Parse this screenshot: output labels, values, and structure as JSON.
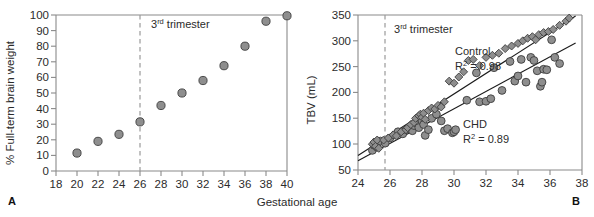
{
  "figure": {
    "shared_xlabel": "Gestational age",
    "panel_a_letter": "A",
    "panel_b_letter": "B",
    "marker_fill": "#8e8e8e",
    "marker_edge": "#3d3d3d",
    "axis_color": "#8a8a8a",
    "line_color": "#1b1b1b"
  },
  "chart_data": [
    {
      "type": "scatter",
      "panel": "A",
      "title": "",
      "xlabel": "Gestational age",
      "ylabel": "% Full-term brain weight",
      "xlim": [
        18,
        40
      ],
      "ylim": [
        0,
        100
      ],
      "xticks": [
        18,
        20,
        22,
        24,
        26,
        28,
        30,
        32,
        34,
        36,
        38,
        40
      ],
      "yticks": [
        0,
        10,
        20,
        30,
        40,
        50,
        60,
        70,
        80,
        90,
        100
      ],
      "grid": false,
      "legend": "none",
      "annotations": [
        {
          "text_main": "3",
          "text_sup": "rd",
          "text_rest": " trimester",
          "full": "3rd trimester",
          "x": 26.6,
          "y": 92
        }
      ],
      "vlines": [
        {
          "x": 26,
          "style": "dashed",
          "label": "3rd trimester"
        }
      ],
      "series": [
        {
          "name": "brain weight",
          "marker": "circle",
          "x": [
            20,
            22,
            24,
            26,
            28,
            30,
            32,
            34,
            36,
            38,
            40
          ],
          "values": [
            11.5,
            19,
            23.5,
            31.5,
            42,
            50,
            58,
            67.5,
            80,
            96,
            99.5
          ]
        }
      ]
    },
    {
      "type": "scatter",
      "panel": "B",
      "title": "",
      "xlabel": "Gestational age",
      "ylabel": "TBV (mL)",
      "xlim": [
        24,
        38
      ],
      "ylim": [
        50,
        350
      ],
      "xticks": [
        24,
        26,
        28,
        30,
        32,
        34,
        36,
        38
      ],
      "yticks": [
        50,
        100,
        150,
        200,
        250,
        300,
        350
      ],
      "grid": false,
      "legend": "inline-labels",
      "annotations": [
        {
          "text_main": "3",
          "text_sup": "rd",
          "text_rest": " trimester",
          "full": "3rd trimester",
          "x": 26.1,
          "y": 318
        },
        {
          "full": "Control",
          "x": 30.9,
          "y": 268
        },
        {
          "full": "R2 = 0.98",
          "r2_value": "0.98",
          "x": 30.9,
          "y": 251
        },
        {
          "full": "CHD",
          "x": 31.5,
          "y": 160
        },
        {
          "full": "R2 = 0.89",
          "r2_value": "0.89",
          "x": 31.5,
          "y": 143
        }
      ],
      "vlines": [
        {
          "x": 25.7,
          "style": "dashed",
          "label": "3rd trimester"
        }
      ],
      "fit_lines": [
        {
          "name": "Control",
          "x0": 24.0,
          "y0": 78,
          "x1": 37.6,
          "y1": 348
        },
        {
          "name": "CHD",
          "x0": 24.0,
          "y0": 68,
          "x1": 37.6,
          "y1": 296
        }
      ],
      "series": [
        {
          "name": "Control",
          "label": "Control",
          "r2": 0.98,
          "marker": "diamond",
          "x": [
            24.9,
            25.0,
            25.1,
            25.2,
            25.3,
            25.6,
            25.9,
            26.2,
            26.4,
            26.7,
            27.0,
            27.1,
            27.3,
            27.5,
            27.6,
            27.8,
            27.9,
            28.0,
            28.1,
            28.2,
            28.4,
            28.6,
            28.8,
            29.0,
            29.2,
            29.4,
            29.7,
            30.0,
            30.3,
            30.6,
            30.9,
            31.2,
            31.6,
            32.0,
            32.4,
            32.8,
            33.2,
            33.6,
            34.0,
            34.3,
            34.6,
            34.9,
            35.1,
            35.3,
            35.6,
            35.9,
            36.2,
            36.6,
            37.0,
            37.2
          ],
          "values": [
            100,
            104,
            96,
            108,
            92,
            108,
            112,
            118,
            116,
            124,
            128,
            132,
            138,
            142,
            150,
            155,
            158,
            152,
            160,
            148,
            165,
            170,
            168,
            175,
            172,
            182,
            222,
            218,
            230,
            240,
            262,
            264,
            252,
            268,
            272,
            276,
            285,
            290,
            295,
            300,
            305,
            308,
            302,
            312,
            316,
            318,
            322,
            330,
            338,
            344
          ]
        },
        {
          "name": "CHD",
          "label": "CHD",
          "r2": 0.89,
          "marker": "circle",
          "x": [
            24.9,
            25.0,
            25.1,
            25.2,
            25.4,
            25.7,
            26.0,
            26.3,
            26.5,
            26.8,
            27.0,
            27.2,
            27.4,
            27.5,
            27.7,
            27.8,
            28.0,
            28.1,
            28.2,
            28.4,
            28.6,
            28.9,
            29.2,
            29.4,
            29.6,
            29.9,
            30.0,
            30.1,
            30.8,
            31.4,
            31.6,
            32.0,
            32.3,
            32.5,
            33.0,
            33.5,
            33.8,
            34.0,
            34.2,
            34.5,
            34.8,
            35.0,
            35.2,
            35.4,
            35.5,
            35.6,
            35.8,
            36.1,
            36.3,
            36.6
          ],
          "values": [
            88,
            98,
            104,
            94,
            106,
            102,
            112,
            118,
            124,
            120,
            128,
            130,
            126,
            136,
            140,
            132,
            145,
            138,
            117,
            128,
            150,
            158,
            145,
            126,
            130,
            122,
            124,
            128,
            185,
            238,
            182,
            183,
            188,
            248,
            204,
            260,
            222,
            232,
            264,
            220,
            268,
            262,
            242,
            212,
            220,
            245,
            244,
            302,
            268,
            256
          ]
        }
      ]
    }
  ]
}
